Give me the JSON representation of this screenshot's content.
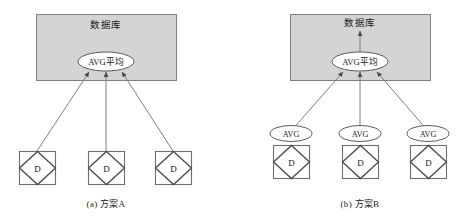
{
  "figure": {
    "background_color": "#ffffff",
    "box_fill_color": "#d4d4d4",
    "box_stroke_color": "#808080",
    "arrow_color": "#7d7d86",
    "node_stroke_color": "#4a4a4a"
  },
  "panels": [
    {
      "id": "panel-a",
      "caption": "(a) 方案A",
      "database_box": {
        "title": "数据库",
        "has_arrow_to_title": false
      },
      "aggregate_ellipse": {
        "label": "AVG平均"
      },
      "leaf_ellipses": [],
      "leaf_nodes": [
        {
          "label": "D"
        },
        {
          "label": "D"
        },
        {
          "label": "D"
        }
      ]
    },
    {
      "id": "panel-b",
      "caption": "(b) 方案B",
      "database_box": {
        "title": "数据库",
        "has_arrow_to_title": true
      },
      "aggregate_ellipse": {
        "label": "AVG平均"
      },
      "leaf_ellipses": [
        {
          "label": "AVG"
        },
        {
          "label": "AVG"
        },
        {
          "label": "AVG"
        }
      ],
      "leaf_nodes": [
        {
          "label": "D"
        },
        {
          "label": "D"
        },
        {
          "label": "D"
        }
      ]
    }
  ]
}
